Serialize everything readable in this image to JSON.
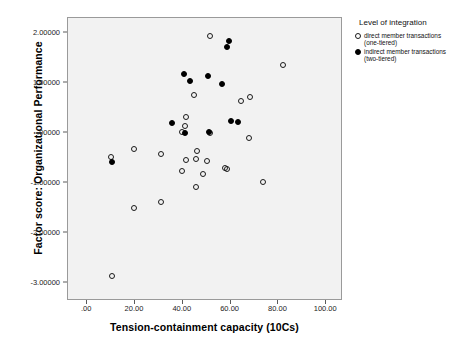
{
  "chart_data": {
    "type": "scatter",
    "title": "",
    "xlabel": "Tension-containment capacity (10Cs)",
    "ylabel": "Factor score: Organizational Performance",
    "xlim": [
      -8,
      107
    ],
    "ylim": [
      -3.35,
      2.3
    ],
    "xticks": [
      ".00",
      "20.00",
      "40.00",
      "60.00",
      "80.00",
      "100.00"
    ],
    "xtick_values": [
      0,
      20,
      40,
      60,
      80,
      100
    ],
    "yticks": [
      "2.00000",
      "1.00000",
      ".00000",
      "-1.00000",
      "-2.00000",
      "-3.00000"
    ],
    "ytick_values": [
      2,
      1,
      0,
      -1,
      -2,
      -3
    ],
    "grid": false,
    "legend_position": "right",
    "series": [
      {
        "name": "direct member transactions (one-tiered)",
        "marker": "open-circle",
        "color": "#000000",
        "points": [
          [
            51.5,
            1.95
          ],
          [
            82.0,
            1.37
          ],
          [
            44.5,
            0.76
          ],
          [
            68.0,
            0.72
          ],
          [
            64.5,
            0.64
          ],
          [
            41.5,
            0.32
          ],
          [
            41.0,
            0.14
          ],
          [
            39.5,
            0.03
          ],
          [
            51.5,
            0.0
          ],
          [
            67.5,
            -0.09
          ],
          [
            19.5,
            -0.32
          ],
          [
            46.0,
            -0.35
          ],
          [
            31.0,
            -0.42
          ],
          [
            10.0,
            -0.48
          ],
          [
            45.5,
            -0.51
          ],
          [
            41.5,
            -0.54
          ],
          [
            50.0,
            -0.55
          ],
          [
            57.5,
            -0.69
          ],
          [
            58.5,
            -0.71
          ],
          [
            39.5,
            -0.75
          ],
          [
            48.5,
            -0.82
          ],
          [
            73.5,
            -0.98
          ],
          [
            45.5,
            -1.07
          ],
          [
            31.0,
            -1.38
          ],
          [
            19.5,
            -1.49
          ],
          [
            10.5,
            -2.85
          ]
        ]
      },
      {
        "name": "indirect member transactions (two-tiered)",
        "marker": "filled-circle",
        "color": "#000000",
        "points": [
          [
            59.5,
            1.85
          ],
          [
            58.5,
            1.72
          ],
          [
            40.5,
            1.18
          ],
          [
            50.5,
            1.14
          ],
          [
            43.0,
            1.05
          ],
          [
            56.5,
            0.98
          ],
          [
            60.0,
            0.24
          ],
          [
            63.0,
            0.23
          ],
          [
            35.5,
            0.2
          ],
          [
            51.0,
            0.03
          ],
          [
            41.0,
            0.0
          ],
          [
            10.5,
            -0.57
          ]
        ]
      }
    ]
  },
  "axes": {
    "x_title": "Tension-containment capacity (10Cs)",
    "y_title": "Factor score: Organizational Performance",
    "x_tick_labels": [
      ".00",
      "20.00",
      "40.00",
      "60.00",
      "80.00",
      "100.00"
    ],
    "y_tick_labels": [
      "2.00000",
      "1.00000",
      ".00000",
      "-1.00000",
      "-2.00000",
      "-3.00000"
    ]
  },
  "legend": {
    "title": "Level of integration",
    "entries": [
      {
        "marker": "open-circle",
        "line1": "direct member transactions",
        "line2": "(one-tiered)"
      },
      {
        "marker": "filled-circle",
        "line1": "indirect member transactions",
        "line2": "(two-tiered)"
      }
    ]
  },
  "style": {
    "plot_background": "#f2f2f2",
    "frame_color": "#9a9a9a",
    "marker_color": "#000000",
    "page_background": "#ffffff"
  }
}
